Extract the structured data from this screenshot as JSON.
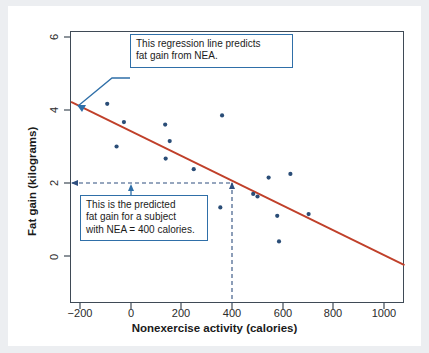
{
  "chart_data": {
    "type": "scatter",
    "title": "",
    "xlabel": "Nonexercise activity (calories)",
    "ylabel": "Fat gain (kilograms)",
    "xlim": [
      -317,
      1081
    ],
    "ylim": [
      -1.2,
      6.6
    ],
    "xticks": [
      -200,
      0,
      200,
      400,
      600,
      800,
      1000
    ],
    "xtick_labels": [
      "−200",
      "0",
      "200",
      "400",
      "600",
      "800",
      "1000"
    ],
    "yticks": [
      0,
      2,
      4,
      6
    ],
    "ytick_labels": [
      "0",
      "2",
      "4",
      "6"
    ],
    "grid": false,
    "legend": "none",
    "point_color": "#2a4d77",
    "line_color": "#c0402a",
    "annotation_color": "#2f6fa8",
    "points": [
      {
        "x": -94,
        "y": 4.17
      },
      {
        "x": -28,
        "y": 3.67
      },
      {
        "x": -57,
        "y": 3.0
      },
      {
        "x": 135,
        "y": 3.6
      },
      {
        "x": 153,
        "y": 3.15
      },
      {
        "x": 137,
        "y": 2.67
      },
      {
        "x": 248,
        "y": 2.38
      },
      {
        "x": 360,
        "y": 3.85
      },
      {
        "x": 353,
        "y": 1.33
      },
      {
        "x": 544,
        "y": 2.15
      },
      {
        "x": 630,
        "y": 2.25
      },
      {
        "x": 483,
        "y": 1.7
      },
      {
        "x": 500,
        "y": 1.63
      },
      {
        "x": 578,
        "y": 1.1
      },
      {
        "x": 585,
        "y": 0.4
      },
      {
        "x": 702,
        "y": 1.15
      }
    ],
    "regression_line": {
      "label": "regression line",
      "slope": -0.00344,
      "intercept": 3.505,
      "x_start": -237,
      "y_start": 4.22,
      "x_end": 1081,
      "y_end": -0.25
    },
    "prediction_guides": {
      "nea_value": 400,
      "predicted_fat_gain": 2.13,
      "horizontal_dashed": true,
      "vertical_dashed": true
    }
  },
  "annotations": {
    "callout_regression": "This regression line predicts\nfat gain from NEA.",
    "callout_prediction": "This is the predicted\nfat gain for a subject\nwith NEA = 400 calories."
  }
}
